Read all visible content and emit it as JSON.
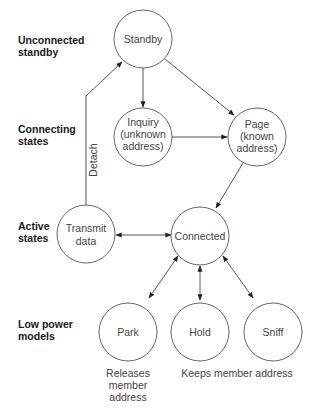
{
  "row_labels": {
    "unconnected": [
      "Unconnected",
      "standby"
    ],
    "connecting": [
      "Connecting",
      "states"
    ],
    "active": [
      "Active",
      "states"
    ],
    "low_power": [
      "Low power",
      "models"
    ]
  },
  "nodes": {
    "standby": [
      "Standby"
    ],
    "inquiry": [
      "Inquiry",
      "(unknown",
      "address)"
    ],
    "page": [
      "Page",
      "(known",
      "address)"
    ],
    "transmit": [
      "Transmit",
      "data"
    ],
    "connected": [
      "Connected"
    ],
    "park": [
      "Park"
    ],
    "hold": [
      "Hold"
    ],
    "sniff": [
      "Sniff"
    ]
  },
  "edge_labels": {
    "detach": "Detach"
  },
  "notes": {
    "park_note": [
      "Releases",
      "member",
      "address"
    ],
    "keeps_note": "Keeps member address"
  },
  "colors": {
    "line": "#444444",
    "text": "#444444",
    "label": "#1a1a1a"
  }
}
